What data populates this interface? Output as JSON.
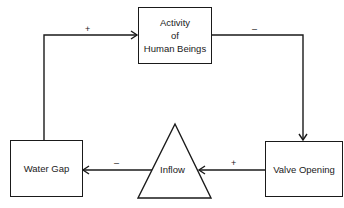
{
  "diagram": {
    "type": "causal-loop",
    "nodes": [
      {
        "id": "activity",
        "label_lines": [
          "Activity",
          "of",
          "Human Beings"
        ],
        "shape": "rectangle"
      },
      {
        "id": "valve",
        "label": "Valve Opening",
        "shape": "rectangle"
      },
      {
        "id": "inflow",
        "label": "Inflow",
        "shape": "triangle"
      },
      {
        "id": "water_gap",
        "label": "Water Gap",
        "shape": "rectangle"
      }
    ],
    "edges": [
      {
        "from": "water_gap",
        "to": "activity",
        "sign": "+"
      },
      {
        "from": "activity",
        "to": "valve",
        "sign": "–"
      },
      {
        "from": "valve",
        "to": "inflow",
        "sign": "+"
      },
      {
        "from": "inflow",
        "to": "water_gap",
        "sign": "–"
      }
    ]
  },
  "labels": {
    "activity_line1": "Activity",
    "activity_line2": "of",
    "activity_line3": "Human Beings",
    "valve": "Valve Opening",
    "inflow": "Inflow",
    "water_gap": "Water Gap",
    "sign_gap_to_activity": "+",
    "sign_activity_to_valve": "–",
    "sign_valve_to_inflow": "+",
    "sign_inflow_to_gap": "–"
  }
}
